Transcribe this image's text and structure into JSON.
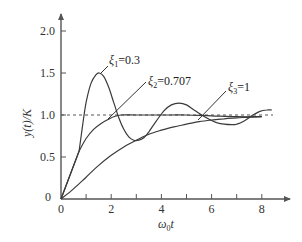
{
  "chart_data": {
    "type": "line",
    "title": "",
    "xlabel": "ω0t",
    "ylabel": "y(t)/K",
    "xlim": [
      0,
      9
    ],
    "ylim": [
      0,
      2.2
    ],
    "xticks": [
      0,
      1,
      2,
      3,
      4,
      5,
      6,
      7,
      8
    ],
    "xtick_labels": [
      "0",
      "",
      "2",
      "",
      "4",
      "",
      "6",
      "",
      "8"
    ],
    "yticks": [
      0,
      0.5,
      1.0,
      1.5,
      2.0
    ],
    "ytick_labels": [
      "0",
      "0.5",
      "1.0",
      "1.5",
      "2.0"
    ],
    "grid": false,
    "legend": "inline labels with leader lines",
    "reference_line": {
      "y": 1.0,
      "style": "dashed"
    },
    "series": [
      {
        "name": "ξ1=0.3",
        "label_main": "ξ",
        "label_sub": "1",
        "label_value": "=0.3",
        "x": [
          0,
          0.72,
          0.85,
          1.0,
          1.2,
          1.4,
          1.52,
          1.7,
          1.9,
          2.1,
          2.3,
          2.5,
          2.7,
          2.9,
          3.1,
          3.3,
          3.5,
          3.8,
          4.1,
          4.4,
          4.7,
          5.0,
          5.3,
          5.6,
          5.9,
          6.2,
          6.5,
          6.8,
          7.0,
          7.3,
          7.6,
          7.9,
          8.2,
          8.4
        ],
        "y": [
          0,
          0.57,
          0.85,
          1.15,
          1.38,
          1.48,
          1.5,
          1.46,
          1.33,
          1.15,
          0.97,
          0.83,
          0.74,
          0.7,
          0.7,
          0.73,
          0.8,
          0.93,
          1.05,
          1.12,
          1.14,
          1.12,
          1.06,
          1.0,
          0.95,
          0.91,
          0.89,
          0.885,
          0.89,
          0.93,
          0.99,
          1.04,
          1.06,
          1.06
        ]
      },
      {
        "name": "ξ2=0.707",
        "label_main": "ξ",
        "label_sub": "2",
        "label_value": "=0.707",
        "x": [
          0,
          0.72,
          1.0,
          1.3,
          1.6,
          1.9,
          2.1,
          2.4,
          3.0,
          4.0,
          5.0,
          6.0,
          7.0,
          8.0
        ],
        "y": [
          0,
          0.57,
          0.72,
          0.83,
          0.9,
          0.95,
          0.98,
          1.0,
          1.0,
          1.0,
          1.0,
          0.99,
          0.98,
          0.98
        ]
      },
      {
        "name": "ξ3=1",
        "label_main": "ξ",
        "label_sub": "3",
        "label_value": "=1",
        "x": [
          0,
          0.5,
          1.0,
          1.5,
          2.0,
          2.5,
          3.0,
          3.5,
          4.0,
          4.5,
          5.0,
          5.5,
          6.0,
          6.5,
          7.0,
          7.5,
          8.0
        ],
        "y": [
          0,
          0.12,
          0.26,
          0.4,
          0.52,
          0.62,
          0.7,
          0.77,
          0.82,
          0.86,
          0.89,
          0.92,
          0.94,
          0.955,
          0.965,
          0.975,
          0.98
        ]
      }
    ]
  },
  "axes": {
    "x_label_main": "ω",
    "x_label_sub": "0",
    "x_label_tail": "t",
    "y_label": "y(t)/K"
  }
}
